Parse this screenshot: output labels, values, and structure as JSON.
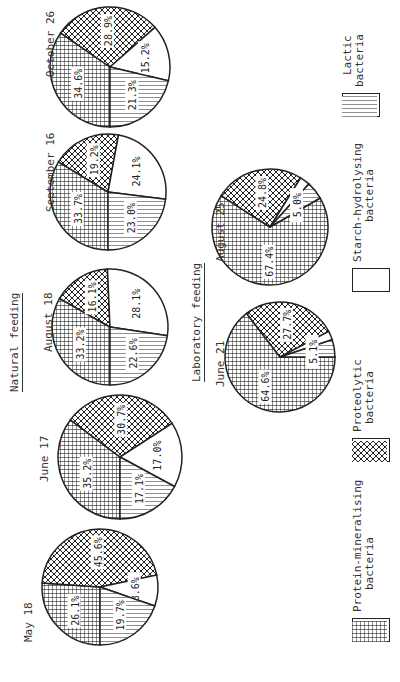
{
  "chart_data": {
    "type": "pie",
    "title": "",
    "categories": [
      "Protein-mineralising bacteria",
      "Proteolytic bacteria",
      "Starch-hydrolysing bacteria",
      "Lactic bacteria"
    ],
    "groups": [
      {
        "name": "Natural feeding",
        "charts": [
          {
            "label": "May 18",
            "values": [
              26.1,
              45.6,
              8.6,
              19.7
            ],
            "labels": [
              "26.1%",
              "45.6%",
              "8.6%",
              "19.7%"
            ]
          },
          {
            "label": "June 17",
            "values": [
              35.2,
              30.7,
              17.0,
              17.1
            ],
            "labels": [
              "35.2%",
              "30.7%",
              "17.0%",
              "17.1%"
            ]
          },
          {
            "label": "August 18",
            "values": [
              33.2,
              16.1,
              28.1,
              22.6
            ],
            "labels": [
              "33.2%",
              "16.1%",
              "28.1%",
              "22.6%"
            ]
          },
          {
            "label": "September 16",
            "values": [
              33.7,
              19.2,
              24.1,
              23.0
            ],
            "labels": [
              "33.7%",
              "19.2%",
              "24.1%",
              "23.0%"
            ]
          },
          {
            "label": "October 26",
            "values": [
              34.6,
              28.9,
              15.2,
              21.3
            ],
            "labels": [
              "34.6%",
              "28.9%",
              "15.2%",
              "21.3%"
            ]
          }
        ]
      },
      {
        "name": "Laboratory feeding",
        "charts": [
          {
            "label": "June 21",
            "values": [
              64.6,
              27.7,
              2.6,
              5.1
            ],
            "labels": [
              "64.6%",
              "27.7%",
              "",
              "5.1%"
            ]
          },
          {
            "label": "August 25",
            "values": [
              67.4,
              24.8,
              2.8,
              5.0
            ],
            "labels": [
              "67.4%",
              "24.8%",
              "",
              "5.0%"
            ]
          }
        ]
      }
    ],
    "legend_position": "bottom"
  },
  "groups": {
    "natural": "Natural feeding",
    "laboratory": "Laboratory feeding"
  },
  "dates": {
    "may18": "May 18",
    "jun17": "June 17",
    "aug18": "August 18",
    "sep16": "September 16",
    "oct26": "October 26",
    "jun21": "June 21",
    "aug25": "August 25"
  },
  "legend": {
    "protein1": "Protein-mineralising",
    "protein2": "bacteria",
    "proteo1": "Proteolytic",
    "proteo2": "bacteria",
    "starch1": "Starch-hydrolysing",
    "starch2": "bacteria",
    "lactic1": "Lactic",
    "lactic2": "bacteria"
  }
}
